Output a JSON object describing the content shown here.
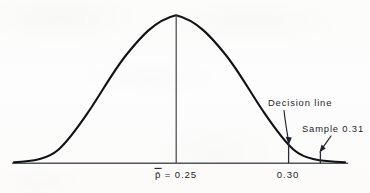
{
  "figure": {
    "background_color": "#fdfdfc",
    "ink_color": "#1a1a1f",
    "curve_color": "#111116",
    "axis_color": "#55555c"
  },
  "axis": {
    "name": "horizontal-axis",
    "x_start": 12,
    "x_end": 348,
    "y": 163
  },
  "center_line": {
    "label_text": "p",
    "label_overbar": "̄",
    "label_equals": " = ",
    "label_value": "0.25",
    "full_label": "p̄ = 0.25",
    "x": 176
  },
  "ticks": [
    {
      "name": "decision-line-tick",
      "label": "0.30",
      "x": 288
    },
    {
      "name": "sample-tick",
      "label": "",
      "x": 320
    }
  ],
  "annotations": [
    {
      "name": "decision-line-annotation",
      "text": "Decision line",
      "text_x": 268,
      "text_y": 106,
      "arrow_from_x": 285,
      "arrow_from_y": 110,
      "arrow_to_x": 289,
      "arrow_to_y": 143
    },
    {
      "name": "sample-annotation",
      "text": "Sample 0.31",
      "text_x": 302,
      "text_y": 132,
      "arrow_from_x": 330,
      "arrow_from_y": 136,
      "arrow_to_x": 320,
      "arrow_to_y": 152
    }
  ],
  "chart_data": {
    "type": "line",
    "xlabel": "",
    "ylabel": "",
    "distribution": "normal",
    "mean": 0.25,
    "mean_label": "p̄ = 0.25",
    "grid": false,
    "legend": "none",
    "x_tick_labels": [
      "p̄ = 0.25",
      "0.30"
    ],
    "x_tick_values": [
      0.25,
      0.3
    ],
    "vertical_markers": [
      {
        "label": "p̄ = 0.25",
        "value": 0.25,
        "kind": "mean-line"
      },
      {
        "label": "Decision line",
        "value": 0.3,
        "kind": "decision-line"
      },
      {
        "label": "Sample 0.31",
        "value": 0.31,
        "kind": "sample-line"
      }
    ],
    "annotations": [
      "Decision line",
      "Sample 0.31"
    ],
    "curve_points_px": [
      [
        14,
        162
      ],
      [
        26,
        160
      ],
      [
        38,
        157
      ],
      [
        50,
        152
      ],
      [
        62,
        144
      ],
      [
        74,
        133
      ],
      [
        86,
        119
      ],
      [
        98,
        103
      ],
      [
        110,
        86
      ],
      [
        122,
        67
      ],
      [
        134,
        50
      ],
      [
        146,
        35
      ],
      [
        158,
        23
      ],
      [
        170,
        16
      ],
      [
        176,
        15
      ],
      [
        182,
        16
      ],
      [
        194,
        23
      ],
      [
        206,
        35
      ],
      [
        218,
        50
      ],
      [
        230,
        67
      ],
      [
        242,
        86
      ],
      [
        254,
        103
      ],
      [
        266,
        119
      ],
      [
        278,
        133
      ],
      [
        288,
        143
      ],
      [
        300,
        150
      ],
      [
        312,
        155
      ],
      [
        320,
        157
      ],
      [
        332,
        160
      ],
      [
        345,
        162
      ]
    ]
  }
}
